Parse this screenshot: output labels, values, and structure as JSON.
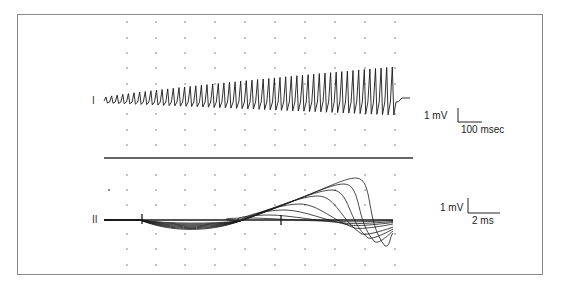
{
  "figure": {
    "panels": [
      {
        "id": "I",
        "label": "I",
        "description": "Surface EMG trace during repetitive stimulation showing progressively increasing (incrementing) compound muscle action potential amplitude",
        "scale_bar": {
          "vertical": "1 mV",
          "horizontal": "100 msec"
        }
      },
      {
        "id": "II",
        "label": "II",
        "description": "Superimposed individual responses on expanded time base",
        "scale_bar": {
          "vertical": "1 mV",
          "horizontal": "2 ms"
        }
      }
    ],
    "colors": {
      "trace": "#1a1a1a",
      "grid_dot": "#555555",
      "frame": "#8a8a8a",
      "separator": "#333333"
    }
  }
}
